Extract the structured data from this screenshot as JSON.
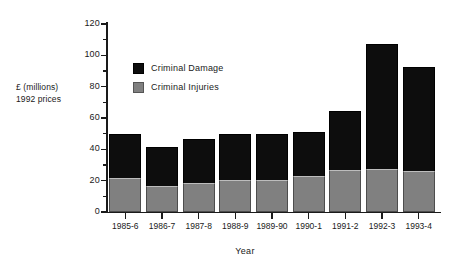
{
  "chart_data": {
    "type": "bar",
    "stacked": true,
    "title": "",
    "xlabel": "Year",
    "ylabel": "£ (millions)\n1992 prices",
    "ylabel_lines": [
      "£ (millions)",
      "1992 prices"
    ],
    "categories": [
      "1985-6",
      "1986-7",
      "1987-8",
      "1988-9",
      "1989-90",
      "1990-1",
      "1991-2",
      "1992-3",
      "1993-4"
    ],
    "series": [
      {
        "name": "Criminal Injuries",
        "color": "#808080",
        "values": [
          21.7,
          16.6,
          18.5,
          20.4,
          20.4,
          23.0,
          26.8,
          27.4,
          26.2
        ]
      },
      {
        "name": "Criminal Damage",
        "color": "#0d0d0d",
        "values": [
          28.1,
          24.9,
          28.1,
          29.4,
          29.4,
          28.0,
          37.7,
          79.6,
          66.3
        ]
      }
    ],
    "totals": [
      49.8,
      41.5,
      46.6,
      49.8,
      49.8,
      51.0,
      64.5,
      107.0,
      92.5
    ],
    "ylim": [
      0,
      120
    ],
    "yticks": [
      0,
      20,
      40,
      60,
      80,
      100,
      120
    ],
    "ytick_labels": [
      "0",
      "20",
      "40",
      "60",
      "80",
      "100",
      "120"
    ],
    "yminor_interval": 10,
    "grid": false,
    "legend_position": "inside-upper-left",
    "legend_entries": [
      "Criminal Damage",
      "Criminal Injuries"
    ]
  }
}
